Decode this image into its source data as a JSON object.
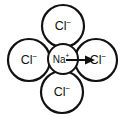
{
  "figure": {
    "background_color": "#ffffff",
    "stroke_color": "#111111",
    "width": 124,
    "height": 118
  },
  "ions": {
    "center": {
      "species": "Na",
      "charge": "+",
      "label": "Na",
      "role": "cation",
      "cx": 63,
      "cy": 59,
      "r": 15
    },
    "neighbors": [
      {
        "position": "top",
        "species": "Cl",
        "charge": "−",
        "label": "Cl",
        "role": "anion",
        "cx": 63,
        "cy": 26,
        "r": 21
      },
      {
        "position": "left",
        "species": "Cl",
        "charge": "−",
        "label": "Cl",
        "role": "anion",
        "cx": 29,
        "cy": 60,
        "r": 21
      },
      {
        "position": "right",
        "species": "Cl",
        "charge": "−",
        "label": "Cl",
        "role": "anion",
        "cx": 96,
        "cy": 60,
        "r": 21
      },
      {
        "position": "bottom",
        "species": "Cl",
        "charge": "−",
        "label": "Cl",
        "role": "anion",
        "cx": 62,
        "cy": 92,
        "r": 21
      }
    ]
  },
  "arrow": {
    "name": "attraction-arrow",
    "description": "arrow from sodium ion toward right chloride ion",
    "x_start": 66,
    "x_end": 95,
    "y": 60,
    "direction": "right"
  }
}
